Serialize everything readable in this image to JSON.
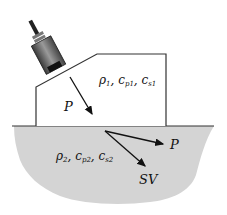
{
  "diagram": {
    "upper_medium": {
      "label": "ρ1, cp1, cs1",
      "rho": "ρ",
      "rho_sub": "1",
      "cp": "c",
      "cp_sub": "p1",
      "cs": "c",
      "cs_sub": "s1"
    },
    "lower_medium": {
      "label": "ρ2, cp2, cs2",
      "rho": "ρ",
      "rho_sub": "2",
      "cp": "c",
      "cp_sub": "p2",
      "cs": "c",
      "cs_sub": "s2"
    },
    "incident_wave": {
      "label": "P"
    },
    "refracted_p_wave": {
      "label": "P"
    },
    "refracted_sv_wave": {
      "label": "SV"
    },
    "colors": {
      "lower_medium_fill": "#d4d4d4",
      "outline": "#333333",
      "transducer_body": "#6e6e6e"
    }
  }
}
